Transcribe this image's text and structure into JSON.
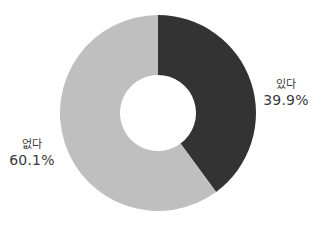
{
  "chart_data": {
    "type": "pie",
    "donut": true,
    "title": "",
    "categories": [
      "있다",
      "없다"
    ],
    "values": [
      39.9,
      60.1
    ],
    "value_labels": [
      "39.9%",
      "60.1%"
    ],
    "colors": [
      "#333333",
      "#bfbfbf"
    ],
    "start_angle_deg": 0,
    "direction": "clockwise",
    "legend": "none",
    "labels_position": "outside"
  },
  "labels": {
    "yes": {
      "category": "있다",
      "percent": "39.9%"
    },
    "no": {
      "category": "없다",
      "percent": "60.1%"
    }
  },
  "geometry": {
    "cx": 158,
    "cy": 113,
    "outer_r": 98,
    "inner_r": 38
  }
}
